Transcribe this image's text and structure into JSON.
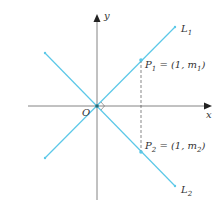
{
  "diagram": {
    "axes": {
      "x_label": "x",
      "y_label": "y",
      "origin_label": "O"
    },
    "lines": [
      {
        "name": "L1",
        "label_main": "L",
        "label_sub": "1",
        "color": "#5bc8e8"
      },
      {
        "name": "L2",
        "label_main": "L",
        "label_sub": "2",
        "color": "#5bc8e8"
      }
    ],
    "points": [
      {
        "name": "P1",
        "label_main": "P",
        "label_sub": "1",
        "coord_prefix": " = (1, ",
        "coord_var": "m",
        "coord_sub": "1",
        "coord_suffix": ")"
      },
      {
        "name": "P2",
        "label_main": "P",
        "label_sub": "2",
        "coord_prefix": " = (1, ",
        "coord_var": "m",
        "coord_sub": "2",
        "coord_suffix": ")"
      }
    ],
    "colors": {
      "line": "#5bc8e8",
      "axis": "#555555"
    }
  }
}
